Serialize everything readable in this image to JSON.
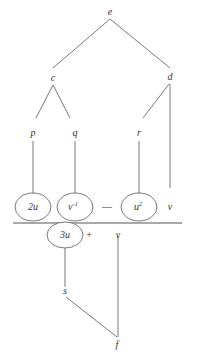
{
  "diagram": {
    "nodes": {
      "e": "e",
      "c": "c",
      "d": "d",
      "p": "p",
      "q": "q",
      "r": "r",
      "v_top": "v",
      "s": "s",
      "f": "f",
      "v_bottom": "v"
    },
    "top_terms": [
      {
        "base": "2u",
        "sup": ""
      },
      {
        "base": "v",
        "sup": "-1"
      },
      {
        "base": "u",
        "sup": "2"
      }
    ],
    "top_operator": "—",
    "bottom_term": {
      "base": "3u"
    },
    "bottom_operator": "+",
    "colors": {
      "line": "#6a6a6a",
      "text": "#333333"
    }
  }
}
